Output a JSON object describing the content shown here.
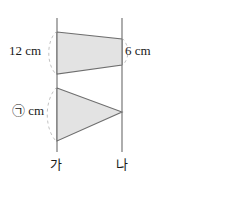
{
  "figure": {
    "colors": {
      "shape_fill": "#e3e3e3",
      "shape_stroke": "#6e6e6e",
      "axis_line": "#6b6b6b",
      "dash_arc": "#c2c2c2",
      "text": "#1a1a1a",
      "background": "#ffffff"
    },
    "axes": {
      "left_label": "가",
      "right_label": "나"
    },
    "measurements": {
      "left_top": "12 cm",
      "right_top": "6 cm",
      "left_bottom": "㉠ cm"
    },
    "shapes": [
      {
        "name": "top-trapezoid",
        "points": "57,32 122,39 122,65 57,74"
      },
      {
        "name": "bottom-triangle",
        "points": "57,88 122,112 57,141"
      }
    ]
  },
  "answer": {
    "open_paren": "(",
    "close_paren": ")",
    "value": ""
  }
}
